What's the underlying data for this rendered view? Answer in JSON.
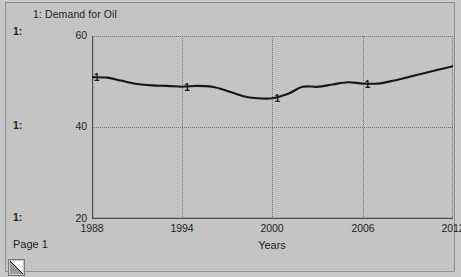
{
  "window": {
    "page_label": "Page 1",
    "corner_grip_icon": "resize-corner-icon"
  },
  "chart_header": {
    "title": "1: Demand for Oil"
  },
  "scale_gutter": {
    "labels": [
      "1:",
      "1:",
      "1:"
    ]
  },
  "chart_data": {
    "type": "line",
    "title": "1: Demand for Oil",
    "xlabel": "Years",
    "ylabel": "",
    "xlim": [
      1988,
      2012
    ],
    "ylim": [
      20,
      60
    ],
    "xticks": [
      "1988",
      "1994",
      "2000",
      "2006",
      "2012"
    ],
    "yticks": [
      "60",
      "40",
      "20"
    ],
    "grid": true,
    "legend": [
      "1: Demand for Oil"
    ],
    "series": [
      {
        "name": "1",
        "marker_label": "1",
        "marker_years": [
          1988,
          1994,
          2000,
          2006
        ],
        "color": "#111111",
        "x": [
          1988,
          1989,
          1990,
          1991,
          1992,
          1993,
          1994,
          1995,
          1996,
          1997,
          1998,
          1999,
          2000,
          2001,
          2002,
          2003,
          2004,
          2005,
          2006,
          2007,
          2008,
          2009,
          2010,
          2011,
          2012
        ],
        "values": [
          51.0,
          50.9,
          50.2,
          49.5,
          49.2,
          49.1,
          48.9,
          49.1,
          48.9,
          48.0,
          46.9,
          46.4,
          46.4,
          47.3,
          48.9,
          48.9,
          49.4,
          49.9,
          49.6,
          49.6,
          50.2,
          51.0,
          51.8,
          52.6,
          53.4
        ]
      }
    ]
  }
}
